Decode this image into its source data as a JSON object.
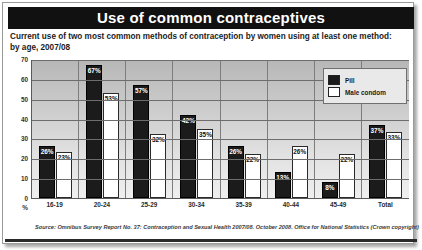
{
  "title": "Use of common contraceptives",
  "subtitle_line1": "Current use of two most common methods of contraception by women using at least one method:",
  "subtitle_line2": "by age, 2007/08",
  "axis": {
    "y_unit": "%",
    "y_ticks": [
      "70",
      "60",
      "50",
      "40",
      "30",
      "20",
      "10",
      "0"
    ]
  },
  "legend": {
    "items": [
      {
        "label": "Pill",
        "color": "#1b1b1b"
      },
      {
        "label": "Male condom",
        "color": "#ffffff"
      }
    ]
  },
  "source": "Source: Omnibus Survey Report No. 37: Contraception and Sexual Health 2007/08. October 2008. Office for National Statistics (Crown copyright)",
  "chart_data": {
    "type": "bar",
    "title": "Use of common contraceptives",
    "subtitle": "Current use of two most common methods of contraception by women using at least one method: by age, 2007/08",
    "xlabel": "",
    "ylabel": "%",
    "ylim": [
      0,
      70
    ],
    "ytick_step": 10,
    "grid": true,
    "legend_position": "top-right",
    "categories": [
      "16-19",
      "20-24",
      "25-29",
      "30-34",
      "35-39",
      "40-44",
      "45-49",
      "Total"
    ],
    "series": [
      {
        "name": "Pill",
        "color": "#1b1b1b",
        "values": [
          26,
          67,
          57,
          42,
          26,
          13,
          8,
          37
        ],
        "labels": [
          "26%",
          "67%",
          "57%",
          "42%",
          "26%",
          "13%",
          "8%",
          "37%"
        ]
      },
      {
        "name": "Male condom",
        "color": "#ffffff",
        "values": [
          23,
          53,
          32,
          35,
          22,
          26,
          22,
          33
        ],
        "labels": [
          "23%",
          "53%",
          "32%",
          "35%",
          "22%",
          "26%",
          "22%",
          "33%"
        ]
      }
    ]
  }
}
